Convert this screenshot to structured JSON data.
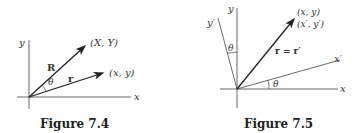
{
  "figures": [
    {
      "caption": "Figure 7.4",
      "labels": {
        "y_axis": "y",
        "x_axis": "x",
        "R_vec": "R",
        "r_vec": "r",
        "angle": "θ",
        "R_tip": "(X, Y)",
        "r_tip": "(x, y)"
      }
    },
    {
      "caption": "Figure 7.5",
      "labels": {
        "y_axis": "y",
        "x_axis": "x",
        "y_prime_axis": "y′",
        "x_prime_axis": "x′",
        "vec": "r = r′",
        "angle_top": "θ",
        "angle_bottom": "θ",
        "tip_1": "(x, y)",
        "tip_2": "(x′, y′)"
      }
    }
  ],
  "colors": {
    "ink": "#222222"
  }
}
